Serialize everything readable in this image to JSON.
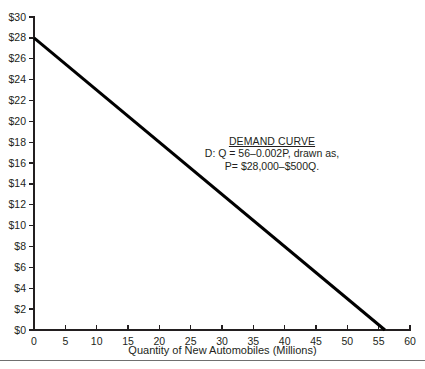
{
  "chart_data": {
    "type": "line",
    "title": "",
    "xlabel": "Quantity of New Automobiles (Millions)",
    "ylabel": "",
    "xlim": [
      0,
      60
    ],
    "ylim": [
      0,
      30
    ],
    "grid": false,
    "legend": "none",
    "x_ticks": [
      "0",
      "5",
      "10",
      "15",
      "20",
      "25",
      "30",
      "35",
      "40",
      "45",
      "50",
      "55",
      "60"
    ],
    "x_tick_values": [
      0,
      5,
      10,
      15,
      20,
      25,
      30,
      35,
      40,
      45,
      50,
      55,
      60
    ],
    "y_ticks": [
      "$0",
      "$2",
      "$4",
      "$6",
      "$8",
      "$10",
      "$12",
      "$14",
      "$16",
      "$18",
      "$20",
      "$22",
      "$24",
      "$26",
      "$28",
      "$30"
    ],
    "y_tick_values": [
      0,
      2,
      4,
      6,
      8,
      10,
      12,
      14,
      16,
      18,
      20,
      22,
      24,
      26,
      28,
      30
    ],
    "series": [
      {
        "name": "Demand curve",
        "x": [
          0,
          56
        ],
        "y": [
          28,
          0
        ],
        "color": "#000000",
        "line_width": 3
      }
    ],
    "annotations": [
      {
        "name": "demand-curve-label",
        "title": "DEMAND CURVE",
        "lines": [
          "D: Q = 56–0.002P, drawn as,",
          "P= $28,000–$500Q."
        ],
        "x": 30,
        "y": 16
      }
    ]
  },
  "annotation": {
    "title": "DEMAND CURVE",
    "line1": "D: Q = 56–0.002P, drawn as,",
    "line2": "P= $28,000–$500Q."
  },
  "axes": {
    "x_title": "Quantity of New Automobiles (Millions)"
  },
  "colors": {
    "curve": "#000000",
    "axis": "#231f20",
    "text": "#231f20",
    "rule": "#6f6f6f"
  }
}
